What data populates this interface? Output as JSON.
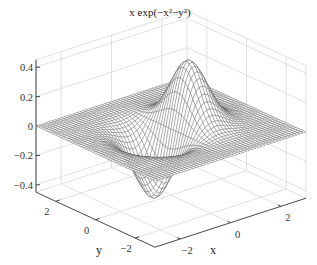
{
  "chart_data": {
    "type": "surface",
    "title": "x exp(−x²−y²)",
    "function": "z = x * exp(-x^2 - y^2)",
    "xlabel": "x",
    "ylabel": "y",
    "zlabel": "",
    "xlim": [
      -3,
      3
    ],
    "ylim": [
      -3,
      3
    ],
    "zlim": [
      -0.45,
      0.45
    ],
    "x_ticks": [
      -2,
      0,
      2
    ],
    "y_ticks": [
      2,
      0,
      -2
    ],
    "z_ticks": [
      0.4,
      0.2,
      0,
      -0.2,
      -0.4
    ],
    "x_tick_labels": [
      "−2",
      "0",
      "2"
    ],
    "y_tick_labels": [
      "2",
      "0",
      "−2"
    ],
    "z_tick_labels": [
      "0.4",
      "0.2",
      "0",
      "−0.2",
      "−0.4"
    ],
    "grid": true,
    "mesh_resolution": 49,
    "peak": {
      "x": 0.707,
      "y": 0,
      "z": 0.429
    },
    "trough": {
      "x": -0.707,
      "y": 0,
      "z": -0.429
    },
    "colors": {
      "mesh_line": "#555555",
      "mesh_face": "#ffffff",
      "grid": "#d9d9d9",
      "axis": "#333333"
    }
  }
}
